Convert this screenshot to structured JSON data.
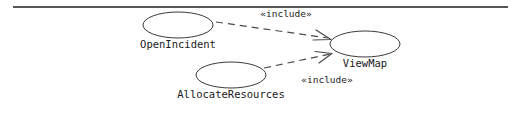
{
  "diagram": {
    "type": "uml-use-case-diagram",
    "background_color": "#ffffff",
    "stroke_color": "#3a3a3a",
    "rule_color": "#1c1c1c",
    "use_cases": [
      {
        "id": "open-incident",
        "label": "OpenIncident",
        "cx": 178,
        "cy": 25,
        "rx": 35,
        "ry": 13,
        "label_x": 178,
        "label_y": 48
      },
      {
        "id": "view-map",
        "label": "ViewMap",
        "cx": 365,
        "cy": 44,
        "rx": 35,
        "ry": 13,
        "label_x": 365,
        "label_y": 67
      },
      {
        "id": "allocate-resources",
        "label": "AllocateResources",
        "cx": 231,
        "cy": 75,
        "rx": 35,
        "ry": 13,
        "label_x": 231,
        "label_y": 98
      }
    ],
    "relationships": [
      {
        "id": "open-incident-includes-view-map",
        "stereotype": "«include»",
        "source": "open-incident",
        "target": "view-map",
        "style": "dashed",
        "arrowhead": "open",
        "path": "M 216 22 L 328 38",
        "arrow_path": "M 316 30 L 330 39 L 314 40",
        "label_x": 286,
        "label_y": 17
      },
      {
        "id": "allocate-resources-includes-view-map",
        "stereotype": "«include»",
        "source": "allocate-resources",
        "target": "view-map",
        "style": "dashed",
        "arrowhead": "open",
        "path": "M 264 68 L 330 54",
        "arrow_path": "M 316 52 L 332 53 L 320 63",
        "label_x": 327,
        "label_y": 83
      }
    ],
    "top_rule": {
      "x1": 13,
      "y1": 7,
      "x2": 508,
      "y2": 7
    }
  }
}
